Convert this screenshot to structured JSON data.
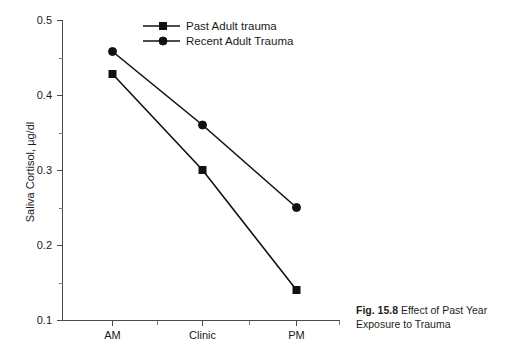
{
  "figure": {
    "caption_number": "Fig. 15.8",
    "caption_text": "Effect of Past Year Exposure to Trauma"
  },
  "chart_data": {
    "type": "line",
    "title": "",
    "xlabel": "",
    "ylabel": "Saliva Cortisol, µg/dl",
    "categories": [
      "AM",
      "Clinic",
      "PM"
    ],
    "series": [
      {
        "name": "Past Adult trauma",
        "marker": "square",
        "color": "#111111",
        "values": [
          0.428,
          0.3,
          0.14
        ]
      },
      {
        "name": "Recent Adult Trauma",
        "marker": "circle",
        "color": "#111111",
        "values": [
          0.458,
          0.36,
          0.25
        ]
      }
    ],
    "ylim": [
      0.1,
      0.5
    ],
    "ytick_labels": [
      "0.5",
      "0.4",
      "0.3",
      "0.2",
      "0.1"
    ],
    "ytick_values": [
      0.5,
      0.4,
      0.3,
      0.2,
      0.1
    ],
    "yminor_values": [
      0.45,
      0.35,
      0.25,
      0.15
    ],
    "grid": false,
    "legend_position": "top-center",
    "legend_entries": [
      "Past Adult trauma",
      "Recent Adult Trauma"
    ]
  }
}
